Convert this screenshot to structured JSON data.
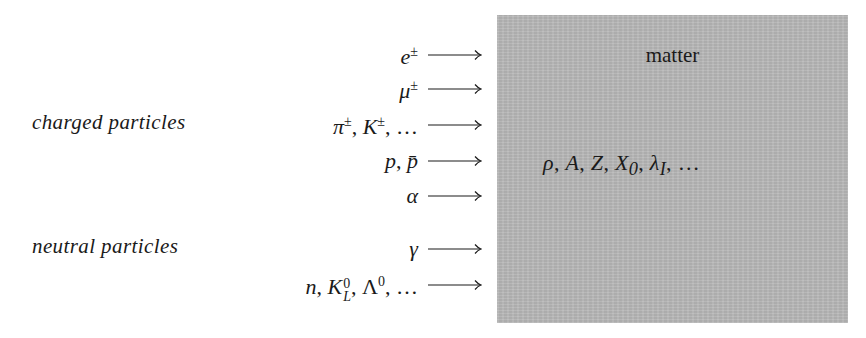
{
  "diagram": {
    "groups": [
      {
        "label": "charged particles"
      },
      {
        "label": "neutral particles"
      }
    ],
    "particles": [
      {
        "label": "e±",
        "group": "charged"
      },
      {
        "label": "μ±",
        "group": "charged"
      },
      {
        "label": "π±, K±, …",
        "group": "charged"
      },
      {
        "label": "p, p̄",
        "group": "charged"
      },
      {
        "label": "α",
        "group": "charged"
      },
      {
        "label": "γ",
        "group": "neutral"
      },
      {
        "label": "n, K⁰_L, Λ⁰, …",
        "group": "neutral"
      }
    ],
    "arrow_icon": "long-right-arrow",
    "matter": {
      "title": "matter",
      "properties": "ρ, A, Z, X₀, λ_I, …",
      "fill_color": "#b9b9b9"
    }
  }
}
